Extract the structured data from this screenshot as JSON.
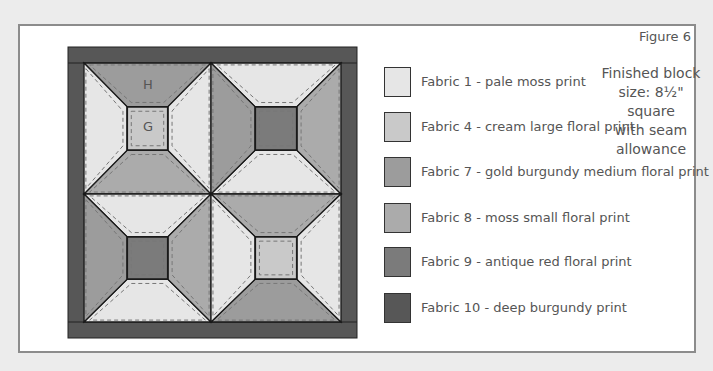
{
  "figure": {
    "label": "Figure 6",
    "note_lines": [
      "Finished block",
      "size: 8½\" square",
      "with seam",
      "allowance"
    ]
  },
  "piece_labels": {
    "top_trapezoid": "H",
    "center_square": "G"
  },
  "legend": [
    {
      "label": "Fabric 1 - pale moss print",
      "color": "#e6e6e6"
    },
    {
      "label": "Fabric 4 - cream large floral print",
      "color": "#c9c9c9"
    },
    {
      "label": "Fabric 7 - gold burgundy medium floral print",
      "color": "#9c9c9c"
    },
    {
      "label": "Fabric 8 - moss small floral print",
      "color": "#ababab"
    },
    {
      "label": "Fabric 9 - antique red floral print",
      "color": "#7b7b7b"
    },
    {
      "label": "Fabric 10 - deep burgundy print",
      "color": "#575757"
    }
  ],
  "blocks": [
    {
      "position": "top-left",
      "top": "#9c9c9c",
      "bottom": "#ababab",
      "left": "#e6e6e6",
      "right": "#e6e6e6",
      "center": "#c9c9c9"
    },
    {
      "position": "top-right",
      "top": "#e6e6e6",
      "bottom": "#e6e6e6",
      "left": "#9c9c9c",
      "right": "#ababab",
      "center": "#7b7b7b"
    },
    {
      "position": "bottom-left",
      "top": "#e6e6e6",
      "bottom": "#e6e6e6",
      "left": "#9c9c9c",
      "right": "#ababab",
      "center": "#7b7b7b"
    },
    {
      "position": "bottom-right",
      "top": "#ababab",
      "bottom": "#9c9c9c",
      "left": "#e6e6e6",
      "right": "#e6e6e6",
      "center": "#c9c9c9"
    }
  ],
  "border_color": "#575757"
}
